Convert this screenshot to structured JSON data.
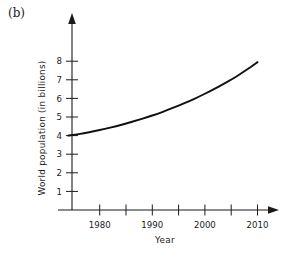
{
  "figure": {
    "panel_label": "(b)",
    "background_color": "#ffffff",
    "ink_color": "#1a1a1a"
  },
  "chart_data": {
    "type": "line",
    "title": "",
    "subtitle": "",
    "xlabel": "Year",
    "ylabel": "World population (in billions)",
    "xlim": [
      1974,
      2014
    ],
    "ylim": [
      0,
      8.6
    ],
    "grid": false,
    "legend": null,
    "x_major_ticks": [
      1980,
      1990,
      2000,
      2010
    ],
    "x_major_tick_labels": [
      "1980",
      "1990",
      "2000",
      "2010"
    ],
    "x_minor_ticks": [
      1985,
      1995,
      2005
    ],
    "y_ticks": [
      1,
      2,
      3,
      4,
      5,
      6,
      7,
      8
    ],
    "y_tick_labels": [
      "1",
      "2",
      "3",
      "4",
      "5",
      "6",
      "7",
      "8"
    ],
    "axis_arrows": [
      "x-right",
      "y-up"
    ],
    "x": [
      1974,
      1976,
      1978,
      1980,
      1982,
      1984,
      1986,
      1988,
      1990,
      1992,
      1994,
      1996,
      1998,
      2000,
      2002,
      2004,
      2006,
      2008,
      2010
    ],
    "y": [
      4.0,
      4.08,
      4.18,
      4.3,
      4.43,
      4.57,
      4.73,
      4.9,
      5.08,
      5.28,
      5.5,
      5.73,
      5.98,
      6.25,
      6.54,
      6.85,
      7.18,
      7.55,
      7.95
    ],
    "annotations": [
      {
        "text": "(b)",
        "position": "top-left"
      }
    ]
  }
}
